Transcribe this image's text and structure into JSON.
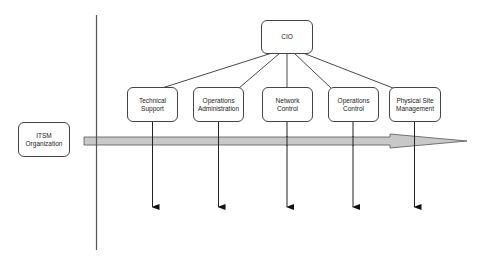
{
  "diagram": {
    "type": "org-chart",
    "root": {
      "id": "cio",
      "label": "CIO"
    },
    "children": [
      {
        "id": "technical-support",
        "label": "Technical\nSupport"
      },
      {
        "id": "operations-administration",
        "label": "Operations\nAdministration"
      },
      {
        "id": "network-control",
        "label": "Network\nControl"
      },
      {
        "id": "operations-control",
        "label": "Operations\nControl"
      },
      {
        "id": "physical-site-management",
        "label": "Physical Site\nManagement"
      }
    ],
    "side_label": {
      "id": "itsm-organization",
      "label": "ITSM\nOrganization"
    },
    "flow_arrow": {
      "direction": "right",
      "fill": "#c8c8c8",
      "stroke": "#555555"
    },
    "colors": {
      "line": "#333333",
      "box_border": "#444444",
      "box_fill": "#ffffff"
    }
  }
}
